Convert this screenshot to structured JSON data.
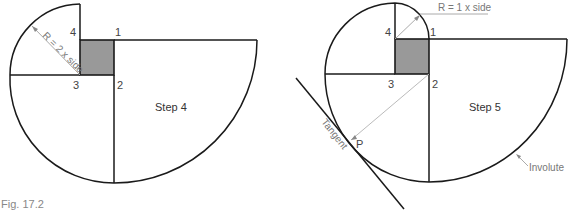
{
  "figure": {
    "caption": "Fig. 17.2",
    "colors": {
      "line": "#1a1a1a",
      "square_fill": "#999999",
      "annotation": "#aaaaaa",
      "label_text": "#444444"
    }
  },
  "step4": {
    "title": "Step 4",
    "corners": [
      "1",
      "2",
      "3",
      "4"
    ],
    "radius_note": "R = 2 x side"
  },
  "step5": {
    "title": "Step 5",
    "corners": [
      "1",
      "2",
      "3",
      "4"
    ],
    "radius_note": "R = 1 x side",
    "tangent_label": "Tangent",
    "point_label": "P",
    "involute_label": "Involute"
  }
}
